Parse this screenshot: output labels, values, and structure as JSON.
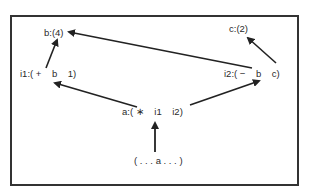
{
  "diagram": {
    "nodes": [
      {
        "id": "b",
        "label": "b:(4)"
      },
      {
        "id": "c",
        "label": "c:(2)"
      },
      {
        "id": "i1",
        "label": "i1:( +    b    1)"
      },
      {
        "id": "i2",
        "label": "i2:( −    b    c)"
      },
      {
        "id": "a",
        "label": "a:( ∗    i1    i2)"
      },
      {
        "id": "expr",
        "label": "( . . . a . . . )"
      }
    ],
    "edges": [
      {
        "from": "i1",
        "to": "b"
      },
      {
        "from": "i2.b",
        "to": "b"
      },
      {
        "from": "i2.c",
        "to": "c"
      },
      {
        "from": "a.i1",
        "to": "i1.b"
      },
      {
        "from": "a.i2",
        "to": "i2.b"
      },
      {
        "from": "expr.a",
        "to": "a"
      }
    ],
    "colors": {
      "line": "#222222",
      "frame": "#333333",
      "text": "#2a2a2a"
    }
  }
}
